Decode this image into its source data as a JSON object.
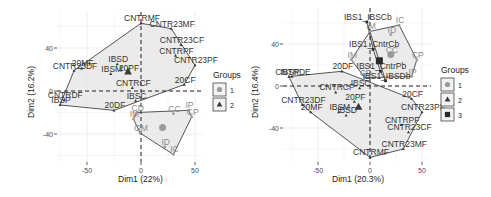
{
  "colors": {
    "group1": "#9a9a9a",
    "group2": "#3a3a3a",
    "group3": "#2a2a2a",
    "hull_fill": "#e4e4e4",
    "hull_stroke": "#555555",
    "grid": "#ebebeb",
    "label1": "#8a8a8a",
    "label2": "#333333"
  },
  "chart_data": [
    {
      "type": "scatter",
      "title": "",
      "xlabel": "Dim1 (22%)",
      "ylabel": "Dim2 (16.2%)",
      "xticks": [
        -50,
        0,
        50
      ],
      "yticks": [
        -40,
        0,
        40
      ],
      "xlim": [
        -80,
        55
      ],
      "ylim": [
        -65,
        72
      ],
      "legend": {
        "title": "Groups",
        "entries": [
          "1",
          "2"
        ],
        "shapes": [
          "circle",
          "triangle"
        ],
        "position": "right"
      },
      "points": [
        {
          "label": "CNTRMF",
          "x": 0,
          "y": 63,
          "group": 2
        },
        {
          "label": "CNTR23MF",
          "x": 28,
          "y": 58,
          "group": 2
        },
        {
          "label": "CNTR23CF",
          "x": 37,
          "y": 43,
          "group": 2
        },
        {
          "label": "CNTRPF",
          "x": 32,
          "y": 33,
          "group": 2
        },
        {
          "label": "CNTR23PF",
          "x": 50,
          "y": 24,
          "group": 2
        },
        {
          "label": "IBSD",
          "x": -22,
          "y": 25,
          "group": 2
        },
        {
          "label": "20MF",
          "x": -55,
          "y": 21,
          "group": 2
        },
        {
          "label": "CNTR23DF",
          "x": -62,
          "y": 19,
          "group": 2
        },
        {
          "label": "20PF",
          "x": -12,
          "y": 17,
          "group": 2
        },
        {
          "label": "IBSM",
          "x": -28,
          "y": 16,
          "group": 2
        },
        {
          "label": "CNTRCF",
          "x": -8,
          "y": 3,
          "group": 2
        },
        {
          "label": "20CF",
          "x": 40,
          "y": 6,
          "group": 2
        },
        {
          "label": "CNTRDF",
          "x": -71,
          "y": -8,
          "group": 2
        },
        {
          "label": "IBSP",
          "x": -75,
          "y": -13,
          "group": 2
        },
        {
          "label": "IBSC",
          "x": -5,
          "y": -9,
          "group": 2
        },
        {
          "label": "20DF",
          "x": -25,
          "y": -18,
          "group": 2
        },
        {
          "label": "CD",
          "x": -4,
          "y": -20,
          "group": 1
        },
        {
          "label": "IP",
          "x": 44,
          "y": -18,
          "group": 1
        },
        {
          "label": "CC",
          "x": 30,
          "y": -21,
          "group": 1
        },
        {
          "label": "CP",
          "x": 47,
          "y": -24,
          "group": 1
        },
        {
          "label": "IM",
          "x": -7,
          "y": -26,
          "group": 1
        },
        {
          "label": "GM",
          "x": -1,
          "y": -39,
          "group": 1
        },
        {
          "label": "ID",
          "x": 22,
          "y": -52,
          "group": 1
        },
        {
          "label": "IC",
          "x": 30,
          "y": -59,
          "group": 1
        }
      ],
      "centroids": [
        {
          "group": 2,
          "x": -12,
          "y": 18
        },
        {
          "group": 1,
          "x": 20,
          "y": -34
        }
      ]
    },
    {
      "type": "scatter",
      "title": "",
      "xlabel": "Dim1 (20.3%)",
      "ylabel": "Dim2 (16.4%)",
      "xticks": [
        -50,
        0,
        50
      ],
      "yticks": [
        -40,
        0,
        40
      ],
      "xlim": [
        -88,
        55
      ],
      "ylim": [
        -72,
        65
      ],
      "legend": {
        "title": "Groups",
        "entries": [
          "1",
          "2",
          "3"
        ],
        "shapes": [
          "circle",
          "triangle",
          "square"
        ],
        "position": "right"
      },
      "points": [
        {
          "label": "IBS1_IBSCb",
          "x": -3,
          "y": 61,
          "group": 3
        },
        {
          "label": "IC",
          "x": 28,
          "y": 58,
          "group": 1
        },
        {
          "label": "IM",
          "x": 0,
          "y": 52,
          "group": 1
        },
        {
          "label": "ID",
          "x": 20,
          "y": 49,
          "group": 1
        },
        {
          "label": "IBS1_CntrCb",
          "x": 3,
          "y": 35,
          "group": 3
        },
        {
          "label": "CC",
          "x": 20,
          "y": 30,
          "group": 1
        },
        {
          "label": "CP",
          "x": 45,
          "y": 25,
          "group": 1
        },
        {
          "label": "IM",
          "x": -18,
          "y": 25,
          "group": 1
        },
        {
          "label": "IBS1_CntrPb",
          "x": 10,
          "y": 14,
          "group": 3
        },
        {
          "label": "IP",
          "x": 40,
          "y": 9,
          "group": 1
        },
        {
          "label": "IBSP",
          "x": -78,
          "y": 9,
          "group": 2
        },
        {
          "label": "20DF",
          "x": -27,
          "y": 14,
          "group": 2
        },
        {
          "label": "CNTRDE",
          "x": -75,
          "y": 9,
          "group": 2
        },
        {
          "label": "CD",
          "x": -5,
          "y": 8,
          "group": 1
        },
        {
          "label": "IBSC",
          "x": -10,
          "y": -2,
          "group": 2
        },
        {
          "label": "IBS1_IBSDb",
          "x": 15,
          "y": 5,
          "group": 3
        },
        {
          "label": "CNTR23DF",
          "x": -65,
          "y": -18,
          "group": 2
        },
        {
          "label": "CNTRCF",
          "x": -33,
          "y": -6,
          "group": 2
        },
        {
          "label": "20CF",
          "x": 40,
          "y": -12,
          "group": 2
        },
        {
          "label": "20PF",
          "x": -15,
          "y": -15,
          "group": 2
        },
        {
          "label": "CNTR23PF",
          "x": 50,
          "y": -25,
          "group": 2
        },
        {
          "label": "IBSM",
          "x": -30,
          "y": -25,
          "group": 2
        },
        {
          "label": "20MF",
          "x": -57,
          "y": -25,
          "group": 2
        },
        {
          "label": "IBSD",
          "x": -23,
          "y": -28,
          "group": 2
        },
        {
          "label": "CNTRPF",
          "x": 30,
          "y": -37,
          "group": 2
        },
        {
          "label": "CNTR23CF",
          "x": 37,
          "y": -44,
          "group": 2
        },
        {
          "label": "CNTR23MF",
          "x": 32,
          "y": -60,
          "group": 2
        },
        {
          "label": "CNTRMF",
          "x": 0,
          "y": -68,
          "group": 2
        }
      ],
      "centroids": [
        {
          "group": 1,
          "x": 20,
          "y": 30
        },
        {
          "group": 2,
          "x": -11,
          "y": -20
        },
        {
          "group": 3,
          "x": 9,
          "y": 24
        }
      ]
    }
  ],
  "plot1": {
    "xlabel": "Dim1 (22%)",
    "ylabel": "Dim2 (16.2%)",
    "xtick_labels": [
      "-50",
      "0",
      "50"
    ],
    "ytick_labels": [
      "40",
      "0",
      "-40"
    ],
    "legend_title": "Groups",
    "legend_entries": [
      "1",
      "2"
    ]
  },
  "plot2": {
    "xlabel": "Dim1 (20.3%)",
    "ylabel": "Dim2 (16.4%)",
    "xtick_labels": [
      "-50",
      "0",
      "50"
    ],
    "ytick_labels": [
      "40",
      "0",
      "-40"
    ],
    "legend_title": "Groups",
    "legend_entries": [
      "1",
      "2",
      "3"
    ]
  }
}
